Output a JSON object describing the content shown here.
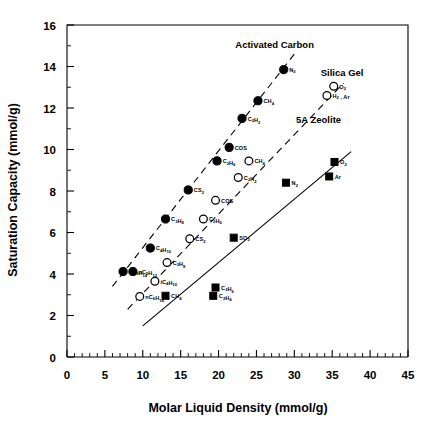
{
  "chart_data": {
    "type": "scatter",
    "title": "",
    "xlabel": "Molar Liquid Density (mmol/g)",
    "ylabel": "Saturation Capacity (mmol/g)",
    "xlim": [
      0,
      45
    ],
    "ylim": [
      0,
      16
    ],
    "xticks": [
      0,
      5,
      10,
      15,
      20,
      25,
      30,
      35,
      40,
      45
    ],
    "yticks": [
      0,
      2,
      4,
      6,
      8,
      10,
      12,
      14,
      16
    ],
    "xtick_labels": [
      "0",
      "5",
      "10",
      "15",
      "20",
      "25",
      "30",
      "35",
      "40",
      "45"
    ],
    "ytick_labels": [
      "0",
      "2",
      "4",
      "6",
      "8",
      "10",
      "12",
      "14",
      "16"
    ],
    "minor_tick_step_x": 1,
    "minor_tick_step_y": 1,
    "grid": false,
    "legend": "inline-annotations",
    "series": [
      {
        "name": "Activated Carbon",
        "marker": "filled-circle",
        "line": "dashed",
        "annotation": "Activated Carbon",
        "annotation_xy": [
          27.4,
          14.9
        ],
        "trend_line": [
          [
            6.0,
            3.4
          ],
          [
            30.0,
            14.6
          ]
        ],
        "points": [
          {
            "label": "nC6H14",
            "html": "nC<sub>6</sub>H<sub>14</sub>",
            "x": 7.4,
            "y": 4.12,
            "label_pos": "right"
          },
          {
            "label": "nC5H12",
            "html": "nC<sub>5</sub>H<sub>12</sub>",
            "x": 8.7,
            "y": 4.12,
            "label_pos": "right"
          },
          {
            "label": "C4H10",
            "html": "C<sub>4</sub>H<sub>10</sub>",
            "x": 11.0,
            "y": 5.25,
            "label_pos": "right"
          },
          {
            "label": "C3H8",
            "html": "C<sub>3</sub>H<sub>8</sub>",
            "x": 13.0,
            "y": 6.65,
            "label_pos": "right"
          },
          {
            "label": "CS2",
            "html": "CS<sub>2</sub>",
            "x": 16.0,
            "y": 8.05,
            "label_pos": "right"
          },
          {
            "label": "C2H6",
            "html": "C<sub>2</sub>H<sub>6</sub>",
            "x": 19.8,
            "y": 9.45,
            "label_pos": "right"
          },
          {
            "label": "COS",
            "html": "COS",
            "x": 21.4,
            "y": 10.1,
            "label_pos": "right"
          },
          {
            "label": "C2H2",
            "html": "C<sub>2</sub>H<sub>2</sub>",
            "x": 23.1,
            "y": 11.5,
            "label_pos": "right"
          },
          {
            "label": "CH4",
            "html": "CH<sub>4</sub>",
            "x": 25.2,
            "y": 12.35,
            "label_pos": "right"
          },
          {
            "label": "N2",
            "html": "N<sub>2</sub>",
            "x": 28.6,
            "y": 13.85,
            "label_pos": "right"
          }
        ]
      },
      {
        "name": "Silica Gel",
        "marker": "open-circle",
        "line": "dashed",
        "annotation": "Silica Gel",
        "annotation_xy": [
          36.3,
          13.55
        ],
        "trend_line": [
          [
            8.0,
            2.3
          ],
          [
            36.5,
            13.2
          ]
        ],
        "points": [
          {
            "label": "nC6H14",
            "html": "nC<sub>6</sub>H<sub>14</sub>",
            "x": 9.6,
            "y": 2.92,
            "label_pos": "right"
          },
          {
            "label": "iC4H10",
            "html": "iC<sub>4</sub>H<sub>10</sub>",
            "x": 11.6,
            "y": 3.65,
            "label_pos": "right"
          },
          {
            "label": "C3H8",
            "html": "C<sub>3</sub>H<sub>8</sub>",
            "x": 13.2,
            "y": 4.55,
            "label_pos": "right"
          },
          {
            "label": "CS2",
            "html": "CS<sub>2</sub>",
            "x": 16.2,
            "y": 5.7,
            "label_pos": "right"
          },
          {
            "label": "C2H6",
            "html": "C<sub>2</sub>H<sub>6</sub>",
            "x": 18.0,
            "y": 6.65,
            "label_pos": "right"
          },
          {
            "label": "COS",
            "html": "COS",
            "x": 19.6,
            "y": 7.55,
            "label_pos": "right"
          },
          {
            "label": "C2H2",
            "html": "C<sub>2</sub>H<sub>2</sub>",
            "x": 22.6,
            "y": 8.65,
            "label_pos": "right"
          },
          {
            "label": "CH4",
            "html": "CH<sub>4</sub>",
            "x": 24.0,
            "y": 9.45,
            "label_pos": "right"
          },
          {
            "label": "O2",
            "html": "O<sub>2</sub>",
            "x": 35.2,
            "y": 13.05,
            "label_pos": "right"
          },
          {
            "label": "H2, Ar",
            "html": "H<sub>2</sub> , Ar",
            "x": 34.3,
            "y": 12.6,
            "label_pos": "right"
          }
        ]
      },
      {
        "name": "5A Zeolite",
        "marker": "filled-square",
        "line": "solid",
        "annotation": "5A Zeolite",
        "annotation_xy": [
          33.2,
          11.3
        ],
        "trend_line": [
          [
            10.0,
            1.5
          ],
          [
            37.5,
            9.9
          ]
        ],
        "points": [
          {
            "label": "CH4",
            "html": "CH<sub>4</sub>",
            "x": 13.0,
            "y": 2.95,
            "label_pos": "right"
          },
          {
            "label": "C2H4",
            "html": "C<sub>2</sub>H<sub>4</sub>",
            "x": 19.3,
            "y": 2.95,
            "label_pos": "right"
          },
          {
            "label": "C2H6",
            "html": "C<sub>2</sub>H<sub>6</sub>",
            "x": 19.6,
            "y": 3.35,
            "label_pos": "right"
          },
          {
            "label": "SO2",
            "html": "SO<sub>2</sub>",
            "x": 22.0,
            "y": 5.75,
            "label_pos": "right"
          },
          {
            "label": "N2",
            "html": "N<sub>2</sub>",
            "x": 28.9,
            "y": 8.4,
            "label_pos": "right"
          },
          {
            "label": "Ar",
            "html": "Ar",
            "x": 34.6,
            "y": 8.7,
            "label_pos": "right"
          },
          {
            "label": "O2",
            "html": "O<sub>2</sub>",
            "x": 35.3,
            "y": 9.4,
            "label_pos": "right"
          }
        ]
      }
    ]
  },
  "colors": {
    "axis": "#000000",
    "marker_fill": "#000000",
    "marker_open": "#ffffff",
    "background": "#ffffff"
  }
}
